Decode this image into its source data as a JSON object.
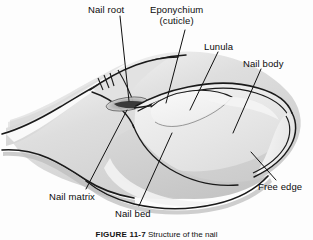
{
  "figure": {
    "background_color": "#fdfdfd",
    "line_color": "#1a1a1a",
    "caption_number": "FIGURE 11-7",
    "caption_text": "Structure of the nail"
  },
  "labels": {
    "nail_root": "Nail root",
    "eponychium_line1": "Eponychium",
    "eponychium_line2": "(cuticle)",
    "lunula": "Lunula",
    "nail_body": "Nail body",
    "nail_matrix": "Nail matrix",
    "nail_bed": "Nail bed",
    "free_edge": "Free edge"
  },
  "illustration": {
    "name": "finger-nail-cutaway-drawing",
    "description": "Grayscale line drawing of a fingertip with the nail, shown from an oblique angle",
    "palette": {
      "skin_light": "#f2f2f2",
      "skin_mid": "#d8d8d8",
      "skin_shadow": "#c2c2c2",
      "nail_plate": "#e9e9e9",
      "lunula": "#f6f6f6",
      "nail_bed": "#cfcfcf",
      "outline": "#1a1a1a"
    }
  }
}
